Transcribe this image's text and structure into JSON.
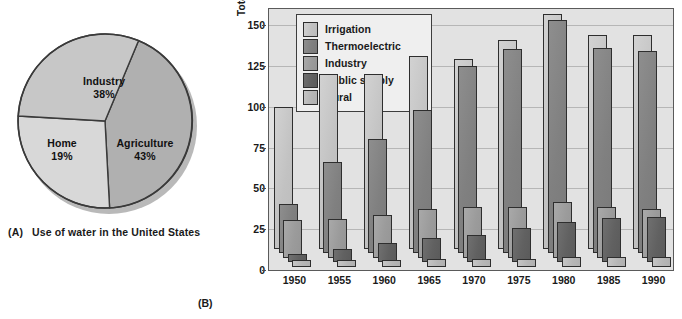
{
  "figure": {
    "panel_a": {
      "tag": "(A)",
      "caption": "Use of water in the United States"
    },
    "panel_b": {
      "tag": "(B)"
    }
  },
  "chart_data": [
    {
      "type": "pie",
      "title": "Use of water in the United States",
      "panel": "(A)",
      "legend": "inside-slices",
      "slices": [
        {
          "label": "Industry",
          "value": 38,
          "value_text": "38%",
          "color": "#c7c7c7"
        },
        {
          "label": "Agriculture",
          "value": 43,
          "value_text": "43%",
          "color": "#b0b0b0"
        },
        {
          "label": "Home",
          "value": 19,
          "value_text": "19%",
          "color": "#d8d8d8"
        }
      ]
    },
    {
      "type": "bar",
      "panel": "(B)",
      "title": "",
      "xlabel": "",
      "ylabel": "Total withdrawals, in thousands of million gallons per day",
      "ylim": [
        0,
        160
      ],
      "yticks": [
        0,
        25,
        50,
        75,
        100,
        125,
        150
      ],
      "ytick_labels": [
        "0",
        "25",
        "50",
        "75",
        "100",
        "125",
        "150"
      ],
      "grid": true,
      "legend_position": "top-left-inside",
      "categories": [
        "1950",
        "1955",
        "1960",
        "1965",
        "1970",
        "1975",
        "1980",
        "1985",
        "1990"
      ],
      "series": [
        {
          "name": "Irrigation",
          "color": "#c2c2c2",
          "values": [
            87,
            107,
            107,
            118,
            116,
            128,
            144,
            131,
            131
          ]
        },
        {
          "name": "Thermoelectric",
          "color": "#808080",
          "values": [
            30,
            56,
            70,
            88,
            115,
            125,
            143,
            126,
            124
          ]
        },
        {
          "name": "Industry",
          "color": "#9b9b9b",
          "values": [
            23,
            24,
            26,
            30,
            31,
            31,
            34,
            31,
            30
          ]
        },
        {
          "name": "Public supply",
          "color": "#616161",
          "values": [
            5,
            8,
            12,
            15,
            17,
            21,
            25,
            27,
            28
          ]
        },
        {
          "name": "Rural",
          "color": "#b6b6b6",
          "values": [
            4,
            4,
            4,
            5,
            5,
            5,
            6,
            6,
            6
          ]
        }
      ]
    }
  ],
  "bar_chart": {
    "ylabel": "Total withdrawals, in thousands of million gallons per day",
    "yticks": [
      "150",
      "125",
      "100",
      "75",
      "50",
      "25",
      "0"
    ],
    "xlabels": [
      "1950",
      "1955",
      "1960",
      "1965",
      "1970",
      "1975",
      "1980",
      "1985",
      "1990"
    ],
    "legend": [
      {
        "label": "Irrigation",
        "swatch": "sw-irrigation"
      },
      {
        "label": "Thermoelectric",
        "swatch": "sw-thermo"
      },
      {
        "label": "Industry",
        "swatch": "sw-industry"
      },
      {
        "label": "Public supply",
        "swatch": "sw-public"
      },
      {
        "label": "Rural",
        "swatch": "sw-rural"
      }
    ]
  },
  "pie_chart": {
    "labels": {
      "industry_name": "Industry",
      "industry_pct": "38%",
      "home_name": "Home",
      "home_pct": "19%",
      "agriculture_name": "Agriculture",
      "agriculture_pct": "43%"
    }
  }
}
